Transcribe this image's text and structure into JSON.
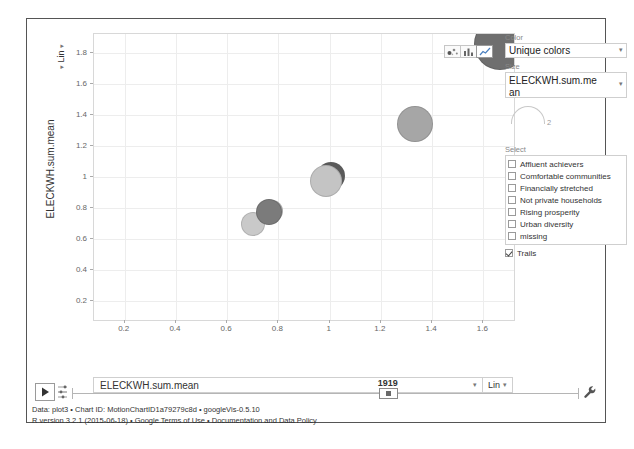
{
  "chart_data": {
    "type": "scatter",
    "title": "",
    "xlabel": "ELECKWH.sum.mean",
    "ylabel": "ELECKWH.sum.mean",
    "xlim": [
      0.08,
      1.72
    ],
    "ylim": [
      0.08,
      1.92
    ],
    "xticks": [
      "0.2",
      "0.4",
      "0.6",
      "0.8",
      "1",
      "1.2",
      "1.4",
      "1.6"
    ],
    "yticks": [
      "0.2",
      "0.4",
      "0.6",
      "0.8",
      "1",
      "1.2",
      "1.4",
      "1.6",
      "1.8"
    ],
    "xtick_values": [
      0.2,
      0.4,
      0.6,
      0.8,
      1.0,
      1.2,
      1.4,
      1.6
    ],
    "ytick_values": [
      0.2,
      0.4,
      0.6,
      0.8,
      1.0,
      1.2,
      1.4,
      1.6,
      1.8
    ],
    "grid": true,
    "legend_position": "right",
    "size_legend_value": "2",
    "points": [
      {
        "x": 0.7,
        "y": 0.7,
        "r": 11,
        "color": "#c9c9c9",
        "trail_dx": 0,
        "trail_dy": 0,
        "trail_r": 0,
        "trail_color": "#9d9d9d"
      },
      {
        "x": 0.765,
        "y": 0.775,
        "r": 12,
        "color": "#7b7b7b",
        "trail_dx": 3,
        "trail_dy": -1,
        "trail_r": 11,
        "trail_color": "#a8a8a8"
      },
      {
        "x": 0.985,
        "y": 0.975,
        "r": 15,
        "color": "#c4c4c4",
        "trail_dx": 5,
        "trail_dy": -5,
        "trail_r": 14,
        "trail_color": "#5a5a5a"
      },
      {
        "x": 1.335,
        "y": 1.34,
        "r": 17,
        "color": "#a6a6a6",
        "trail_dx": 0,
        "trail_dy": 0,
        "trail_r": 0,
        "trail_color": "#8a8a8a"
      },
      {
        "x": 1.665,
        "y": 1.855,
        "r": 25,
        "color": "#6f6f6f",
        "trail_dx": 0,
        "trail_dy": 0,
        "trail_r": 0,
        "trail_color": "#5a5a5a"
      }
    ]
  },
  "axes": {
    "x_label": "ELECKWH.sum.mean",
    "x_scale": "Lin",
    "y_label": "ELECKWH.sum.mean",
    "y_scale": "Lin",
    "caret": "▾"
  },
  "chart_type_toggle": {
    "bubble_icon": "bubble-chart-icon",
    "bar_icon": "bar-chart-icon",
    "line_icon": "line-chart-icon",
    "selected": "line"
  },
  "control_panel": {
    "color_label": "Color",
    "color_value": "Unique colors",
    "size_label": "Size",
    "size_value": "ELECKWH.sum.mean",
    "size_legend_value": "2",
    "select_label": "Select",
    "options": [
      {
        "label": "Affluent achievers",
        "checked": false
      },
      {
        "label": "Comfortable communities",
        "checked": false
      },
      {
        "label": "Financially stretched",
        "checked": false
      },
      {
        "label": "Not private households",
        "checked": false
      },
      {
        "label": "Rising prosperity",
        "checked": false
      },
      {
        "label": "Urban diversity",
        "checked": false
      },
      {
        "label": "missing",
        "checked": false
      }
    ],
    "trails_label": "Trails",
    "trails_checked": true
  },
  "timeline": {
    "value": "1919",
    "position_percent": 62.3,
    "play_icon": "play-icon",
    "speed_icon": "playback-speed-icon",
    "settings_icon": "wrench-icon"
  },
  "footer": {
    "line1": "Data: plot3 • Chart ID: MotionChartID1a79279c8d • googleVis-0.5.10",
    "line2": "R version 3.2.1 (2015-06-18) • Google Terms of Use • Documentation and Data Policy"
  },
  "colors": {
    "frame_border": "#555555",
    "grid": "#ededed",
    "plot_border": "#d8d8d8",
    "panel_border": "#cfcfcf",
    "text": "#333333"
  }
}
